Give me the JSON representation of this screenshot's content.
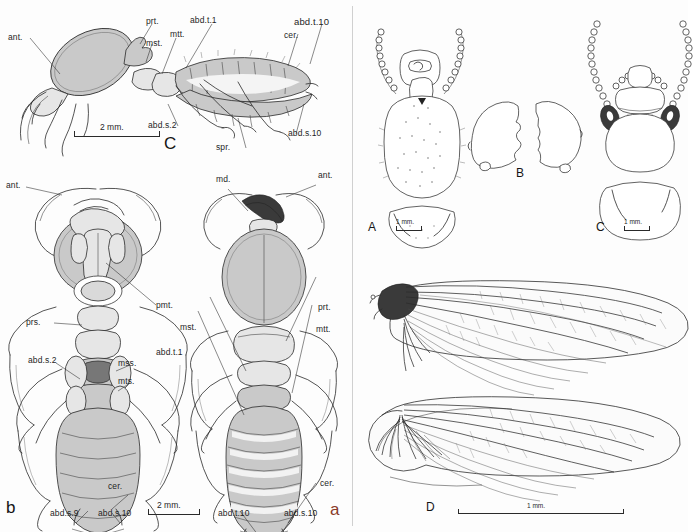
{
  "plate": {
    "title": "Comparative morphological plate of termite castes and wings",
    "background_color": "#fdfdfd",
    "ink_color": "#2a2a2a"
  },
  "panels": [
    {
      "id": "C_lateral",
      "letter": "C",
      "view": "lateral habitus of soldier",
      "scale": "2 mm.",
      "labels": [
        {
          "key": "ant",
          "text": "ant."
        },
        {
          "key": "prt",
          "text": "prt."
        },
        {
          "key": "mst",
          "text": "mst."
        },
        {
          "key": "mtt",
          "text": "mtt."
        },
        {
          "key": "abd_t_1",
          "text": "abd.t.1"
        },
        {
          "key": "abd_t_10",
          "text": "abd.t.10"
        },
        {
          "key": "cer",
          "text": "cer."
        },
        {
          "key": "abd_s_2",
          "text": "abd.s.2"
        },
        {
          "key": "abd_s_10",
          "text": "abd.s.10"
        },
        {
          "key": "spr",
          "text": "spr."
        }
      ]
    },
    {
      "id": "b_ventral",
      "letter": "b",
      "view": "ventral habitus",
      "scale": "2 mm.",
      "labels": [
        {
          "key": "ant",
          "text": "ant."
        },
        {
          "key": "pmt",
          "text": "pmt."
        },
        {
          "key": "prs",
          "text": "prs."
        },
        {
          "key": "abd_s_2",
          "text": "abd.s.2"
        },
        {
          "key": "mss",
          "text": "mss."
        },
        {
          "key": "mts",
          "text": "mts."
        },
        {
          "key": "cer",
          "text": "cer."
        },
        {
          "key": "abd_s_9",
          "text": "abd.s.9"
        },
        {
          "key": "abd_s_10",
          "text": "abd.s.10"
        }
      ]
    },
    {
      "id": "a_dorsal",
      "letter": "a",
      "view": "dorsal habitus",
      "scale": "2 mm.",
      "labels": [
        {
          "key": "md",
          "text": "md."
        },
        {
          "key": "ant",
          "text": "ant."
        },
        {
          "key": "prt",
          "text": "prt."
        },
        {
          "key": "mst",
          "text": "mst."
        },
        {
          "key": "mtt",
          "text": "mtt."
        },
        {
          "key": "abd_t_1",
          "text": "abd.t.1"
        },
        {
          "key": "cer",
          "text": "cer."
        },
        {
          "key": "abd_t_10",
          "text": "abd.t.10"
        },
        {
          "key": "abd_s_10",
          "text": "abd.s.10"
        }
      ]
    },
    {
      "id": "A_head",
      "letter": "A",
      "view": "head capsule dorsal and labrum",
      "scale": "1 mm.",
      "labels": []
    },
    {
      "id": "B_mandibles",
      "letter": "B",
      "view": "left and right mandibles",
      "scale": "",
      "labels": []
    },
    {
      "id": "C_head",
      "letter": "C",
      "view": "head capsule with antennae and postmentum",
      "scale": "1 mm.",
      "labels": []
    },
    {
      "id": "D_wings",
      "letter": "D",
      "view": "fore wing and hind wing",
      "scale": "1 mm.",
      "labels": []
    }
  ],
  "abbreviations": {
    "ant": "antenna",
    "prt": "pronotum",
    "mst": "mesonotum",
    "mtt": "metanotum",
    "abd_t": "abdominal tergite",
    "abd_s": "abdominal sternite",
    "cer": "cercus",
    "spr": "spiracle",
    "pmt": "postmentum",
    "prs": "prosternum",
    "mss": "mesosternum",
    "mts": "metasternum",
    "md": "mandible"
  }
}
